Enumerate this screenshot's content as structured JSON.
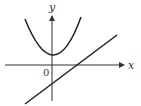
{
  "diagram": {
    "axes": {
      "x_label": "x",
      "y_label": "y",
      "origin_label": "0"
    },
    "curves": [
      {
        "name": "parabola",
        "description": "upward-opening parabola with vertex above x-axis, entirely above x-axis"
      },
      {
        "name": "line",
        "description": "increasing straight line with negative y-intercept, positive x-intercept"
      }
    ],
    "colors": {
      "stroke": "#222222",
      "axis": "#333333"
    }
  }
}
